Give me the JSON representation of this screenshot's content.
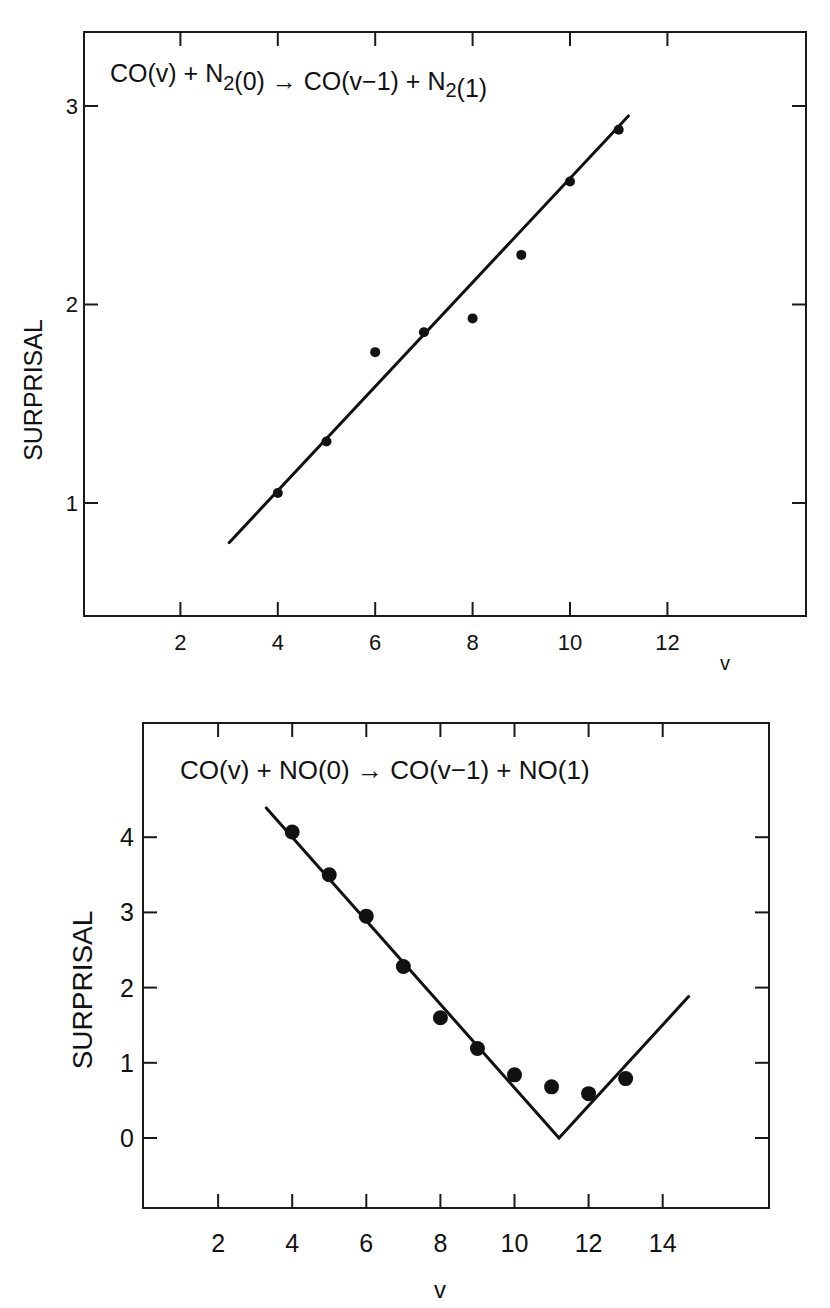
{
  "chart_data": [
    {
      "type": "scatter",
      "title": "CO(v) + N2(0) → CO(v−1) + N2(1)",
      "title_parts": [
        {
          "t": "CO(v) + N",
          "sub": false
        },
        {
          "t": "2",
          "sub": true
        },
        {
          "t": "(0) ",
          "sub": false
        },
        {
          "t": "→",
          "sub": false,
          "arrow": true
        },
        {
          "t": " CO(v−1) + N",
          "sub": false
        },
        {
          "t": "2",
          "sub": true
        },
        {
          "t": "(1)",
          "sub": false
        }
      ],
      "xlabel": "v",
      "ylabel": "SURPRISAL",
      "xticks": [
        2,
        4,
        6,
        8,
        10,
        12
      ],
      "yticks": [
        1,
        2,
        3
      ],
      "xlim": [
        0,
        15
      ],
      "ylim": [
        0.45,
        3.38
      ],
      "grid": false,
      "legend": null,
      "series": [
        {
          "name": "data",
          "kind": "points",
          "x": [
            4,
            5,
            6,
            7,
            8,
            9,
            10,
            11
          ],
          "y": [
            1.05,
            1.31,
            1.76,
            1.86,
            1.93,
            2.25,
            2.62,
            2.88
          ]
        },
        {
          "name": "linear fit",
          "kind": "line",
          "x": [
            3.0,
            11.2
          ],
          "y": [
            0.8,
            2.95
          ]
        }
      ]
    },
    {
      "type": "scatter",
      "title": "CO(v) + NO(0) → CO(v−1) + NO(1)",
      "title_parts": [
        {
          "t": "CO(v) + NO(0) ",
          "sub": false
        },
        {
          "t": "→",
          "sub": false,
          "arrow": true
        },
        {
          "t": " CO(v−1) + NO(1)",
          "sub": false
        }
      ],
      "xlabel": "v",
      "ylabel": "SURPRISAL",
      "xticks": [
        2,
        4,
        6,
        8,
        10,
        12,
        14
      ],
      "yticks": [
        0,
        1,
        2,
        3,
        4
      ],
      "xlim": [
        0,
        16.9
      ],
      "ylim": [
        -0.95,
        5.5
      ],
      "grid": false,
      "legend": null,
      "series": [
        {
          "name": "data",
          "kind": "points",
          "x": [
            4,
            5,
            6,
            7,
            8,
            9,
            10,
            11,
            12,
            13
          ],
          "y": [
            4.07,
            3.5,
            2.95,
            2.28,
            1.6,
            1.19,
            0.84,
            0.68,
            0.59,
            0.79
          ]
        },
        {
          "name": "V-shaped fit",
          "kind": "line",
          "x": [
            3.3,
            11.2,
            14.7
          ],
          "y": [
            4.39,
            0.0,
            1.88
          ]
        }
      ]
    }
  ],
  "panels": [
    {
      "box": {
        "left": 84,
        "top": 32,
        "right": 806,
        "bottom": 616
      },
      "map": {
        "x0px": 83,
        "xscale": 48.7,
        "y0px": 106,
        "y0val": 3,
        "yscale": 198.5
      },
      "tick_len": 14,
      "point_r": 5,
      "title_pos": {
        "x": 110,
        "y": 82,
        "size": 25
      },
      "ticklabel_size": 22,
      "ylabel_pos": {
        "x": 42,
        "y": 390,
        "size": 25
      },
      "xlabel_pos": {
        "x": 725,
        "y": 670,
        "size": 20
      },
      "xtick_label_y": 650,
      "ytick_label_x": 78
    },
    {
      "box": {
        "left": 143,
        "top": 723,
        "right": 769,
        "bottom": 1208
      },
      "map": {
        "x0px": 144,
        "xscale": 37.05,
        "y0px": 1138,
        "y0val": 0,
        "yscale": 75.2
      },
      "tick_len": 14,
      "point_r": 7.5,
      "title_pos": {
        "x": 180,
        "y": 779,
        "size": 26
      },
      "ticklabel_size": 25,
      "ylabel_pos": {
        "x": 92,
        "y": 990,
        "size": 28
      },
      "xlabel_pos": {
        "x": 440,
        "y": 1298,
        "size": 24
      },
      "xtick_label_y": 1252,
      "ytick_label_x": 134
    }
  ]
}
